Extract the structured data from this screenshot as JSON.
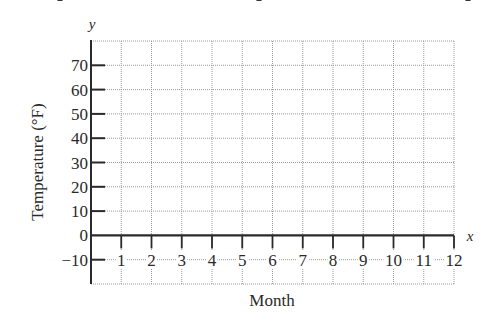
{
  "chart_data": {
    "type": "line",
    "title": "",
    "xlabel": "Month",
    "ylabel": "Temperature (°F)",
    "x_axis_letter": "x",
    "y_axis_letter": "y",
    "x_ticks": [
      "1",
      "2",
      "3",
      "4",
      "5",
      "6",
      "7",
      "8",
      "9",
      "10",
      "11",
      "12"
    ],
    "y_ticks": [
      "70",
      "60",
      "50",
      "40",
      "30",
      "20",
      "10",
      "0",
      "−10"
    ],
    "y_tick_values": [
      70,
      60,
      50,
      40,
      30,
      20,
      10,
      0,
      -10
    ],
    "xlim": [
      0,
      12
    ],
    "ylim": [
      -20,
      80
    ],
    "grid": true,
    "grid_style": "dotted",
    "series": [],
    "legend": null
  },
  "colors": {
    "axis": "#2a2a2a",
    "grid": "#9a9a9a",
    "background": "#ffffff"
  }
}
